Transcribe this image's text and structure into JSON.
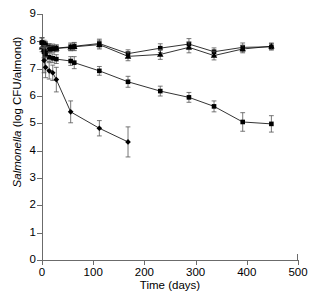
{
  "chart_data": {
    "type": "line",
    "title": "",
    "xlabel": "Time (days)",
    "ylabel": "Salmonella (log CFU/almond)",
    "ylabel_italic_part": "Salmonella",
    "ylabel_rest": " (log CFU/almond)",
    "xlim": [
      0,
      500
    ],
    "ylim": [
      0,
      9
    ],
    "xticks": [
      0,
      100,
      200,
      300,
      400,
      500
    ],
    "yticks": [
      0,
      1,
      2,
      3,
      4,
      5,
      6,
      7,
      8,
      9
    ],
    "grid": false,
    "legend": "none",
    "marker_color": "#000000",
    "line_color": "#000000",
    "errorbar_color": "#555555",
    "series": [
      {
        "name": "series-1-squares-stable",
        "marker": "square",
        "x": [
          0,
          4,
          7,
          14,
          21,
          28,
          56,
          63,
          112,
          168,
          231,
          287,
          336,
          392,
          448
        ],
        "y": [
          7.95,
          7.92,
          7.88,
          7.8,
          7.78,
          7.75,
          7.8,
          7.82,
          7.92,
          7.55,
          7.75,
          7.9,
          7.62,
          7.78,
          7.8
        ],
        "yerr": [
          0.18,
          0.12,
          0.12,
          0.12,
          0.12,
          0.12,
          0.14,
          0.14,
          0.16,
          0.14,
          0.16,
          0.2,
          0.14,
          0.16,
          0.12
        ]
      },
      {
        "name": "series-2-triangles-stable",
        "marker": "triangle",
        "x": [
          0,
          4,
          7,
          14,
          21,
          28,
          56,
          63,
          112,
          168,
          231,
          287,
          336,
          392,
          448
        ],
        "y": [
          7.78,
          7.7,
          7.66,
          7.7,
          7.72,
          7.74,
          7.78,
          7.8,
          7.88,
          7.45,
          7.52,
          7.78,
          7.48,
          7.72,
          7.82
        ],
        "yerr": [
          0.16,
          0.12,
          0.12,
          0.12,
          0.12,
          0.12,
          0.12,
          0.14,
          0.16,
          0.16,
          0.18,
          0.2,
          0.16,
          0.14,
          0.12
        ]
      },
      {
        "name": "series-3-squares-declining",
        "marker": "square",
        "x": [
          0,
          4,
          7,
          14,
          21,
          28,
          56,
          63,
          112,
          168,
          231,
          287,
          336,
          392,
          448
        ],
        "y": [
          7.95,
          7.62,
          7.5,
          7.42,
          7.38,
          7.35,
          7.28,
          7.22,
          6.92,
          6.52,
          6.18,
          5.95,
          5.62,
          5.05,
          4.98
        ],
        "yerr": [
          0.18,
          0.22,
          0.18,
          0.16,
          0.16,
          0.16,
          0.16,
          0.22,
          0.16,
          0.2,
          0.18,
          0.18,
          0.2,
          0.34,
          0.3
        ]
      },
      {
        "name": "series-4-diamonds-declining",
        "marker": "diamond",
        "x": [
          0,
          4,
          7,
          14,
          21,
          28,
          56,
          112,
          168
        ],
        "y": [
          7.95,
          7.3,
          7.05,
          6.92,
          6.85,
          6.6,
          5.42,
          4.82,
          4.32
        ],
        "yerr": [
          0.18,
          0.45,
          0.38,
          0.3,
          0.28,
          0.45,
          0.4,
          0.28,
          0.55
        ]
      }
    ]
  }
}
